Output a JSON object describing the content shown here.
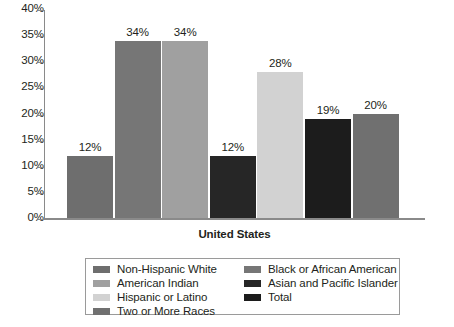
{
  "chart_data": {
    "type": "bar",
    "title": "",
    "subtitle": "",
    "xlabel": "United States",
    "ylabel": "",
    "ylim": [
      0,
      40
    ],
    "grid": false,
    "legend_position": "bottom",
    "categories": [
      "Non-Hispanic White",
      "Black or African American",
      "American Indian",
      "Total",
      "Hispanic or Latino",
      "Asian and Pacific Islander",
      "Two or More Races"
    ],
    "values": [
      12,
      34,
      34,
      12,
      28,
      19,
      20
    ],
    "data_labels": [
      "12%",
      "34%",
      "34%",
      "12%",
      "28%",
      "19%",
      "20%"
    ],
    "bar_colors": [
      "#6e6e6e",
      "#767676",
      "#a0a0a0",
      "#262626",
      "#d2d2d2",
      "#1c1c1c",
      "#707070"
    ],
    "tick_labels": [
      "40%",
      "35%",
      "30%",
      "25%",
      "20%",
      "15%",
      "10%",
      "5%",
      "0%"
    ],
    "tick_values": [
      40,
      35,
      30,
      25,
      20,
      15,
      10,
      5,
      0
    ],
    "axis_color": "#8a8a8a"
  },
  "legend": {
    "columns": [
      {
        "entries": [
          {
            "label": "Non-Hispanic White",
            "color": "#6e6e6e"
          },
          {
            "label": "American Indian",
            "color": "#a0a0a0"
          },
          {
            "label": "Hispanic or Latino",
            "color": "#d2d2d2"
          },
          {
            "label": "Two or More Races",
            "color": "#707070"
          }
        ]
      },
      {
        "entries": [
          {
            "label": "Black or African American",
            "color": "#767676"
          },
          {
            "label": "Asian and Pacific Islander",
            "color": "#262626"
          },
          {
            "label": "Total",
            "color": "#1c1c1c"
          }
        ]
      }
    ]
  }
}
